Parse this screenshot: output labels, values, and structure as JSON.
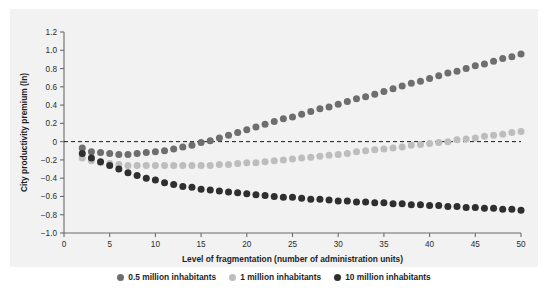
{
  "figure": {
    "title_fragment": "",
    "background": "#ffffff",
    "panel_background": "#f2f2f2"
  },
  "legend": {
    "position": "bottom-center",
    "items": [
      {
        "label": "0.5 million inhabitants",
        "color": "#6e6e6e",
        "marker": "circle"
      },
      {
        "label": "1 million inhabitants",
        "color": "#bdbdbd",
        "marker": "circle"
      },
      {
        "label": "10 million inhabitants",
        "color": "#2f2f2f",
        "marker": "circle"
      }
    ]
  },
  "chart_data": {
    "type": "scatter",
    "title": "",
    "xlabel": "Level of fragmentation (number of administration units)",
    "ylabel": "City productivity premium (ln)",
    "xlim": [
      0,
      50
    ],
    "ylim": [
      -1.0,
      1.2
    ],
    "xticks": [
      0,
      5,
      10,
      15,
      20,
      25,
      30,
      35,
      40,
      45,
      50
    ],
    "xtick_labels": [
      "0",
      "5",
      "10",
      "15",
      "20",
      "25",
      "30",
      "35",
      "40",
      "45",
      "50"
    ],
    "yticks": [
      -1.0,
      -0.8,
      -0.6,
      -0.4,
      -0.2,
      0,
      0.2,
      0.4,
      0.6,
      0.8,
      1.0,
      1.2
    ],
    "ytick_labels": [
      "−1.0",
      "−0.8",
      "−0.6",
      "−0.4",
      "−0.2",
      "0",
      "0.2",
      "0.4",
      "0.6",
      "0.8",
      "1.0",
      "1.2"
    ],
    "grid": false,
    "annotations": [
      {
        "type": "hline",
        "y": 0,
        "style": "dashed",
        "color": "#1a1a1a"
      }
    ],
    "x": [
      2,
      3,
      4,
      5,
      6,
      7,
      8,
      9,
      10,
      11,
      12,
      13,
      14,
      15,
      16,
      17,
      18,
      19,
      20,
      21,
      22,
      23,
      24,
      25,
      26,
      27,
      28,
      29,
      30,
      31,
      32,
      33,
      34,
      35,
      36,
      37,
      38,
      39,
      40,
      41,
      42,
      43,
      44,
      45,
      46,
      47,
      48,
      49,
      50
    ],
    "series": [
      {
        "name": "0.5 million inhabitants",
        "color": "#6e6e6e",
        "values": [
          -0.07,
          -0.11,
          -0.12,
          -0.13,
          -0.14,
          -0.14,
          -0.13,
          -0.12,
          -0.11,
          -0.1,
          -0.08,
          -0.06,
          -0.04,
          -0.01,
          0.01,
          0.04,
          0.07,
          0.1,
          0.13,
          0.16,
          0.19,
          0.22,
          0.25,
          0.27,
          0.3,
          0.33,
          0.36,
          0.38,
          0.41,
          0.44,
          0.47,
          0.49,
          0.52,
          0.55,
          0.58,
          0.61,
          0.64,
          0.66,
          0.69,
          0.72,
          0.75,
          0.77,
          0.8,
          0.83,
          0.85,
          0.88,
          0.91,
          0.93,
          0.96
        ]
      },
      {
        "name": "1 million inhabitants",
        "color": "#bdbdbd",
        "values": [
          -0.18,
          -0.21,
          -0.23,
          -0.24,
          -0.25,
          -0.26,
          -0.26,
          -0.26,
          -0.26,
          -0.26,
          -0.26,
          -0.26,
          -0.26,
          -0.26,
          -0.26,
          -0.25,
          -0.25,
          -0.24,
          -0.23,
          -0.23,
          -0.22,
          -0.21,
          -0.2,
          -0.19,
          -0.18,
          -0.17,
          -0.16,
          -0.15,
          -0.14,
          -0.13,
          -0.11,
          -0.1,
          -0.09,
          -0.08,
          -0.07,
          -0.06,
          -0.04,
          -0.03,
          -0.02,
          -0.01,
          0.0,
          0.02,
          0.03,
          0.04,
          0.06,
          0.07,
          0.08,
          0.1,
          0.11
        ]
      },
      {
        "name": "10 million inhabitants",
        "color": "#2f2f2f",
        "values": [
          -0.13,
          -0.18,
          -0.22,
          -0.26,
          -0.3,
          -0.34,
          -0.37,
          -0.4,
          -0.42,
          -0.45,
          -0.47,
          -0.49,
          -0.5,
          -0.52,
          -0.53,
          -0.54,
          -0.55,
          -0.56,
          -0.57,
          -0.58,
          -0.59,
          -0.6,
          -0.61,
          -0.61,
          -0.62,
          -0.63,
          -0.63,
          -0.64,
          -0.65,
          -0.65,
          -0.66,
          -0.66,
          -0.67,
          -0.67,
          -0.68,
          -0.68,
          -0.69,
          -0.69,
          -0.7,
          -0.7,
          -0.71,
          -0.71,
          -0.72,
          -0.72,
          -0.73,
          -0.73,
          -0.74,
          -0.74,
          -0.75
        ]
      }
    ]
  }
}
